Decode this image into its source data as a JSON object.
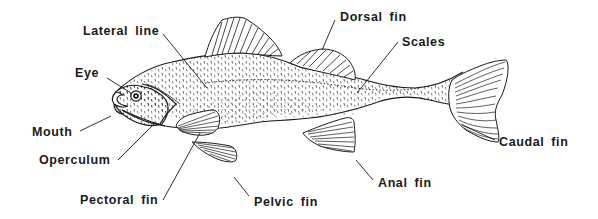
{
  "diagram": {
    "ink_color": "#1a1a1a",
    "background": "#ffffff",
    "labels": {
      "lateral_line": "Lateral line",
      "eye": "Eye",
      "mouth": "Mouth",
      "operculum": "Operculum",
      "pectoral_fin": "Pectoral fin",
      "pelvic_fin": "Pelvic fin",
      "dorsal_fin": "Dorsal fin",
      "scales": "Scales",
      "caudal_fin": "Caudal fin",
      "anal_fin": "Anal fin"
    }
  }
}
